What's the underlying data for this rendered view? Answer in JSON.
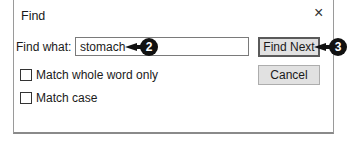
{
  "dialog": {
    "title": "Find",
    "close_icon": "×",
    "find_what_label": "Find what:",
    "find_what_value": "stomach",
    "find_next_label": "Find Next",
    "cancel_label": "Cancel",
    "options": [
      {
        "label": "Match whole word only",
        "checked": false
      },
      {
        "label": "Match case",
        "checked": false
      }
    ]
  },
  "callouts": [
    {
      "number": "2",
      "target": "find-what-input"
    },
    {
      "number": "3",
      "target": "find-next-button"
    }
  ]
}
